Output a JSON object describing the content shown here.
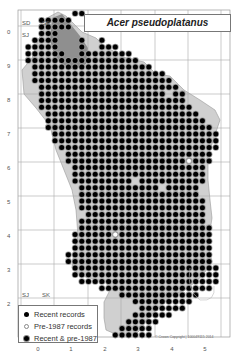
{
  "title": "Acer pseudoplatanus",
  "legend": {
    "items": [
      {
        "label": "Recent records",
        "type": "recent"
      },
      {
        "label": "Pre-1987 records",
        "type": "pre1987"
      },
      {
        "label": "Recent & pre-1987",
        "type": "both"
      }
    ]
  },
  "grid_squares": [
    {
      "label": "SD",
      "x": 22,
      "y": 20
    },
    {
      "label": "SE",
      "x": 42,
      "y": 20
    },
    {
      "label": "SJ",
      "x": 22,
      "y": 32
    },
    {
      "label": "SJ",
      "x": 22,
      "y": 292
    },
    {
      "label": "SK",
      "x": 42,
      "y": 292
    }
  ],
  "axes": {
    "y_labels": [
      {
        "label": "0",
        "y": 32
      },
      {
        "label": "9",
        "y": 66
      },
      {
        "label": "8",
        "y": 100
      },
      {
        "label": "7",
        "y": 134
      },
      {
        "label": "6",
        "y": 168
      },
      {
        "label": "5",
        "y": 202
      },
      {
        "label": "4",
        "y": 236
      },
      {
        "label": "3",
        "y": 270
      },
      {
        "label": "2",
        "y": 304
      }
    ],
    "x_labels": [
      {
        "label": "0",
        "x": 38
      },
      {
        "label": "1",
        "x": 71
      },
      {
        "label": "2",
        "x": 105
      },
      {
        "label": "3",
        "x": 138
      },
      {
        "label": "4",
        "x": 172
      },
      {
        "label": "5",
        "x": 205
      }
    ]
  },
  "copyright": "© Crown Copyright | 100049115 2014",
  "colors": {
    "recent": "#000000",
    "pre1987": "#ffffff",
    "upland_shading": "#9a9a9a",
    "grid": "#aaaaaa",
    "county_fill": "#c8c8c8"
  },
  "dot_grid": {
    "origin_x": 21.5,
    "origin_y": 13.5,
    "step": 6.7,
    "rows": [
      [
        8,
        9
      ],
      [
        3,
        7
      ],
      [
        3,
        7,
        11,
        11
      ],
      [
        3,
        5
      ],
      [
        2,
        5,
        9,
        9,
        12,
        12
      ],
      [
        1,
        5,
        9,
        9,
        12,
        14
      ],
      [
        1,
        5,
        6,
        6,
        9,
        16
      ],
      [
        1,
        17
      ],
      [
        2,
        19
      ],
      [
        2,
        21
      ],
      [
        2,
        22
      ],
      [
        3,
        23
      ],
      [
        3,
        24
      ],
      [
        3,
        24
      ],
      [
        3,
        25
      ],
      [
        4,
        26
      ],
      [
        4,
        27
      ],
      [
        4,
        28
      ],
      [
        5,
        29
      ],
      [
        5,
        29
      ],
      [
        6,
        29
      ],
      [
        7,
        28
      ],
      [
        7,
        28
      ],
      [
        8,
        27
      ],
      [
        8,
        27
      ],
      [
        8,
        27
      ],
      [
        9,
        26
      ],
      [
        9,
        26
      ],
      [
        9,
        27
      ],
      [
        9,
        27
      ],
      [
        10,
        27
      ],
      [
        9,
        27
      ],
      [
        9,
        28
      ],
      [
        8,
        28
      ],
      [
        8,
        28
      ],
      [
        8,
        28
      ],
      [
        7,
        28
      ],
      [
        7,
        28
      ],
      [
        8,
        29
      ],
      [
        8,
        29
      ],
      [
        9,
        29
      ],
      [
        12,
        28
      ],
      [
        15,
        26
      ],
      [
        17,
        25
      ],
      [
        18,
        24
      ],
      [
        17,
        22
      ],
      [
        16,
        20
      ],
      [
        15,
        19
      ],
      [
        14,
        19
      ],
      [
        14,
        18
      ]
    ],
    "empty_cells": [
      [
        12,
        22
      ],
      [
        26,
        21
      ],
      [
        26,
        4
      ],
      [
        25,
        17
      ]
    ],
    "pre1987_cells": [
      [
        22,
        25
      ],
      [
        33,
        14
      ],
      [
        48,
        20
      ]
    ]
  }
}
